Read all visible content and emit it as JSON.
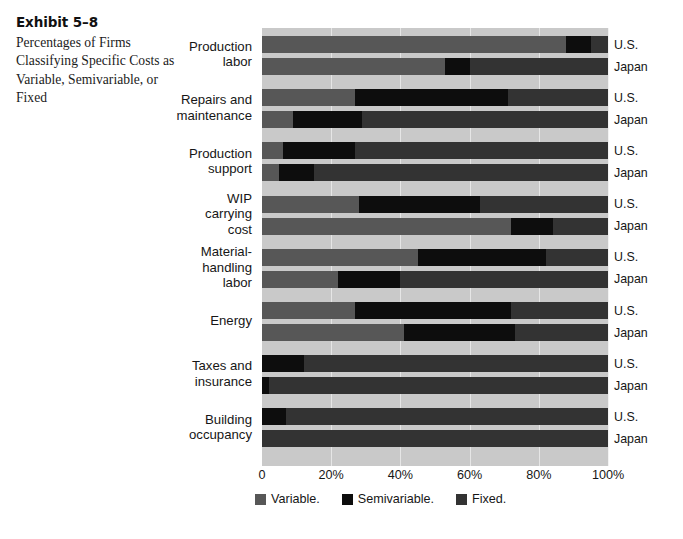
{
  "exhibit": {
    "title": "Exhibit 5–8",
    "description": "Percentages of Firms Classifying Specific Costs as Variable, Semivariable, or Fixed"
  },
  "legend": {
    "position": "bottom",
    "items": [
      {
        "label": "Variable.",
        "color": "#575757",
        "key": "variable"
      },
      {
        "label": "Semivariable.",
        "color": "#0d0d0d",
        "key": "semivariable"
      },
      {
        "label": "Fixed.",
        "color": "#333333",
        "key": "fixed"
      }
    ]
  },
  "axis": {
    "ticks": [
      {
        "label": "0",
        "value": 0
      },
      {
        "label": "20%",
        "value": 20
      },
      {
        "label": "40%",
        "value": 40
      },
      {
        "label": "60%",
        "value": 60
      },
      {
        "label": "80%",
        "value": 80
      },
      {
        "label": "100%",
        "value": 100
      }
    ]
  },
  "series_names": [
    "U.S.",
    "Japan"
  ],
  "chart_data": {
    "type": "bar",
    "orientation": "horizontal",
    "stacked": true,
    "stack_total": 100,
    "title": "Exhibit 5–8",
    "subtitle": "Percentages of Firms Classifying Specific Costs as Variable, Semivariable, or Fixed",
    "xlabel": "",
    "ylabel": "",
    "xlim": [
      0,
      100
    ],
    "xticks": [
      0,
      20,
      40,
      60,
      80,
      100
    ],
    "xticklabels": [
      "0",
      "20%",
      "40%",
      "60%",
      "80%",
      "100%"
    ],
    "grid": "vertical",
    "legend_position": "bottom",
    "segment_names": [
      "Variable.",
      "Semivariable.",
      "Fixed."
    ],
    "categories": [
      "Production labor",
      "Repairs and maintenance",
      "Production support",
      "WIP carrying cost",
      "Material-handling labor",
      "Energy",
      "Taxes and insurance",
      "Building occupancy"
    ],
    "category_label_lines": [
      [
        "Production",
        "labor"
      ],
      [
        "Repairs and",
        "maintenance"
      ],
      [
        "Production",
        "support"
      ],
      [
        "WIP",
        "carrying",
        "cost"
      ],
      [
        "Material-",
        "handling",
        "labor"
      ],
      [
        "Energy"
      ],
      [
        "Taxes and",
        "insurance"
      ],
      [
        "Building",
        "occupancy"
      ]
    ],
    "groups": [
      {
        "category": "Production labor",
        "bars": [
          {
            "series": "U.S.",
            "variable": 88,
            "semivariable": 7,
            "fixed": 5
          },
          {
            "series": "Japan",
            "variable": 53,
            "semivariable": 7,
            "fixed": 40
          }
        ]
      },
      {
        "category": "Repairs and maintenance",
        "bars": [
          {
            "series": "U.S.",
            "variable": 27,
            "semivariable": 44,
            "fixed": 29
          },
          {
            "series": "Japan",
            "variable": 9,
            "semivariable": 20,
            "fixed": 71
          }
        ]
      },
      {
        "category": "Production support",
        "bars": [
          {
            "series": "U.S.",
            "variable": 6,
            "semivariable": 21,
            "fixed": 73
          },
          {
            "series": "Japan",
            "variable": 5,
            "semivariable": 10,
            "fixed": 85
          }
        ]
      },
      {
        "category": "WIP carrying cost",
        "bars": [
          {
            "series": "U.S.",
            "variable": 28,
            "semivariable": 35,
            "fixed": 37
          },
          {
            "series": "Japan",
            "variable": 72,
            "semivariable": 12,
            "fixed": 16
          }
        ]
      },
      {
        "category": "Material-handling labor",
        "bars": [
          {
            "series": "U.S.",
            "variable": 45,
            "semivariable": 37,
            "fixed": 18
          },
          {
            "series": "Japan",
            "variable": 22,
            "semivariable": 18,
            "fixed": 60
          }
        ]
      },
      {
        "category": "Energy",
        "bars": [
          {
            "series": "U.S.",
            "variable": 27,
            "semivariable": 45,
            "fixed": 28
          },
          {
            "series": "Japan",
            "variable": 41,
            "semivariable": 32,
            "fixed": 27
          }
        ]
      },
      {
        "category": "Taxes and insurance",
        "bars": [
          {
            "series": "U.S.",
            "variable": 0,
            "semivariable": 12,
            "fixed": 88
          },
          {
            "series": "Japan",
            "variable": 0,
            "semivariable": 2,
            "fixed": 98
          }
        ]
      },
      {
        "category": "Building occupancy",
        "bars": [
          {
            "series": "U.S.",
            "variable": 0,
            "semivariable": 7,
            "fixed": 93
          },
          {
            "series": "Japan",
            "variable": 0,
            "semivariable": 0,
            "fixed": 100
          }
        ]
      }
    ]
  }
}
